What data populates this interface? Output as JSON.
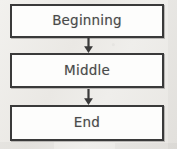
{
  "diagram": {
    "type": "flowchart",
    "orientation": "vertical",
    "title": "",
    "background_color": "#eceae7",
    "node_fill_color": "#fdfdfc",
    "node_border_color": "#3a3a3a",
    "text_color": "#4a4a4a",
    "arrow_color": "#3a3a3a",
    "nodes": [
      {
        "id": "beginning",
        "label": "Beginning",
        "shape": "rectangle"
      },
      {
        "id": "middle",
        "label": "Middle",
        "shape": "rectangle"
      },
      {
        "id": "end",
        "label": "End",
        "shape": "rectangle"
      }
    ],
    "connectors": [
      {
        "id": "connector-1",
        "from": "beginning",
        "to": "middle",
        "style": "arrow-down"
      },
      {
        "id": "connector-2",
        "from": "middle",
        "to": "end",
        "style": "arrow-down"
      }
    ]
  }
}
